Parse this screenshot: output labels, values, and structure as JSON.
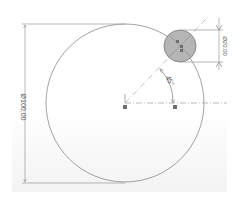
{
  "sketch": {
    "large_circle": {
      "diameter_label": "Ø100.00",
      "diameter": 100.0
    },
    "small_circle": {
      "diameter_label": "Ø20.00",
      "diameter": 20.0,
      "fill": "#b5b5b5"
    },
    "angle": {
      "label": "45°",
      "value": 45
    },
    "colors": {
      "geometry": "#8a8a8a",
      "dimension": "#9a9a9a",
      "centerline": "#a8a8a8",
      "point": "#6e6e6e",
      "small_fill": "#b5b5b5"
    }
  }
}
